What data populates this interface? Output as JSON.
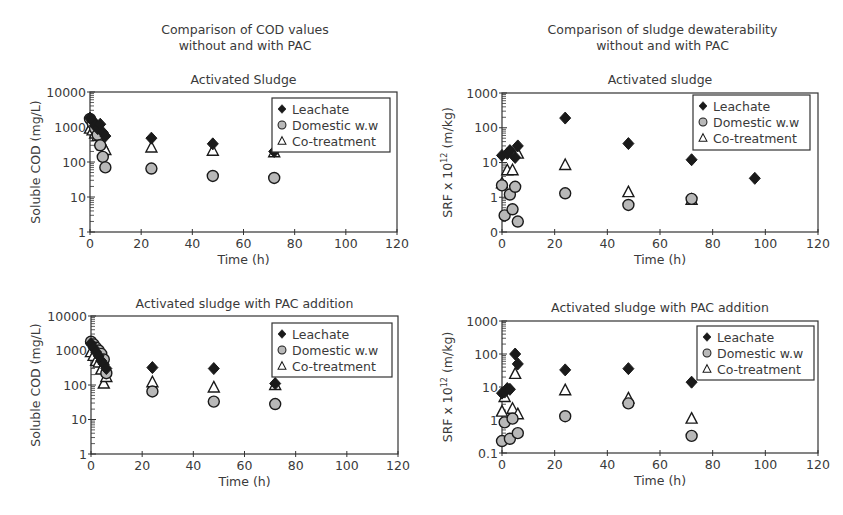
{
  "columns": {
    "left_title_line1": "Comparison of COD values",
    "left_title_line2": "without and with PAC",
    "right_title_line1": "Comparison of sludge dewaterability",
    "right_title_line2": "without and with PAC"
  },
  "legend": {
    "leachate": "Leachate",
    "domestic": "Domestic w.w",
    "cotreatment": "Co-treatment"
  },
  "colors": {
    "leachate_fill": "#1a1a1a",
    "domestic_fill": "#b8b8b8",
    "marker_stroke": "#1a1a1a",
    "axis": "#333333"
  },
  "chart_data": [
    {
      "id": "cod-as",
      "type": "scatter",
      "title": "Activated Sludge",
      "xlabel": "Time (h)",
      "ylabel": "Soluble COD (mg/L)",
      "xlim": [
        0,
        120
      ],
      "ylim": [
        1,
        10000
      ],
      "yscale": "log",
      "xticks": [
        "0",
        "20",
        "40",
        "60",
        "80",
        "100",
        "120"
      ],
      "yticks": [
        "1",
        "10",
        "100",
        "1000",
        "10000"
      ],
      "legend_position": "upper right",
      "grid": false,
      "series": [
        {
          "name": "Leachate",
          "marker": "diamond",
          "x": [
            0,
            1,
            2,
            3,
            4,
            5,
            6,
            24,
            48,
            72
          ],
          "y": [
            1800,
            1500,
            1100,
            900,
            1200,
            700,
            550,
            480,
            330,
            200
          ]
        },
        {
          "name": "Domestic w.w",
          "marker": "circle",
          "x": [
            0,
            1,
            2,
            3,
            4,
            5,
            6,
            24,
            48,
            72
          ],
          "y": [
            1700,
            1300,
            900,
            600,
            300,
            140,
            70,
            65,
            40,
            35
          ]
        },
        {
          "name": "Co-treatment",
          "marker": "triangle",
          "x": [
            0,
            1,
            2,
            3,
            4,
            5,
            6,
            24,
            48,
            72
          ],
          "y": [
            900,
            800,
            650,
            550,
            400,
            300,
            220,
            260,
            210,
            190
          ]
        }
      ]
    },
    {
      "id": "srf-as",
      "type": "scatter",
      "title": "Activated sludge",
      "xlabel": "Time (h)",
      "ylabel": "SRF x 10^12 (m/kg)",
      "xlim": [
        0,
        120
      ],
      "ylim": [
        0.1,
        1000
      ],
      "yscale": "log",
      "xticks": [
        "0",
        "20",
        "40",
        "60",
        "80",
        "100",
        "120"
      ],
      "yticks": [
        "0",
        "1",
        "10",
        "100",
        "1000"
      ],
      "legend_position": "upper right",
      "grid": false,
      "series": [
        {
          "name": "Leachate",
          "marker": "diamond",
          "x": [
            0,
            2,
            3,
            5,
            6,
            24,
            48,
            72,
            96
          ],
          "y": [
            16,
            18,
            22,
            14,
            30,
            190,
            35,
            12,
            3.5
          ]
        },
        {
          "name": "Domestic w.w",
          "marker": "circle",
          "x": [
            1,
            3,
            0,
            4,
            5,
            6,
            24,
            48,
            72
          ],
          "y": [
            0.3,
            1.2,
            2.2,
            0.45,
            2.0,
            0.2,
            1.3,
            0.6,
            0.9
          ]
        },
        {
          "name": "Co-treatment",
          "marker": "triangle",
          "x": [
            0,
            2,
            4,
            6,
            24,
            48,
            72
          ],
          "y": [
            2.5,
            6,
            6,
            18,
            8.5,
            1.4,
            0.85
          ]
        }
      ]
    },
    {
      "id": "cod-pac",
      "type": "scatter",
      "title": "Activated sludge with PAC addition",
      "xlabel": "Time (h)",
      "ylabel": "Soluble COD (mg/L)",
      "xlim": [
        0,
        120
      ],
      "ylim": [
        1,
        10000
      ],
      "yscale": "log",
      "xticks": [
        "0",
        "20",
        "40",
        "60",
        "80",
        "100",
        "120"
      ],
      "yticks": [
        "1",
        "10",
        "100",
        "1000",
        "10000"
      ],
      "legend_position": "upper right",
      "grid": false,
      "series": [
        {
          "name": "Leachate",
          "marker": "diamond",
          "x": [
            0,
            1,
            2,
            3,
            4,
            5,
            6,
            24,
            48,
            72
          ],
          "y": [
            1600,
            1200,
            900,
            700,
            500,
            400,
            300,
            320,
            300,
            110
          ]
        },
        {
          "name": "Domestic w.w",
          "marker": "circle",
          "x": [
            0,
            1,
            2,
            3,
            4,
            5,
            6,
            24,
            48,
            72
          ],
          "y": [
            1800,
            1500,
            1200,
            1000,
            800,
            550,
            220,
            65,
            33,
            28
          ]
        },
        {
          "name": "Co-treatment",
          "marker": "triangle",
          "x": [
            0,
            1,
            2,
            3,
            4,
            5,
            6,
            24,
            48,
            72
          ],
          "y": [
            900,
            700,
            500,
            450,
            280,
            110,
            170,
            120,
            85,
            100
          ]
        }
      ]
    },
    {
      "id": "srf-pac",
      "type": "scatter",
      "title": "Activated sludge with PAC addition",
      "xlabel": "Time (h)",
      "ylabel": "SRF x 10^12 (m/kg)",
      "xlim": [
        0,
        120
      ],
      "ylim": [
        0.1,
        1000
      ],
      "yscale": "log",
      "xticks": [
        "0",
        "20",
        "40",
        "60",
        "80",
        "100",
        "120"
      ],
      "yticks": [
        "0.1",
        "1",
        "10",
        "100",
        "1000"
      ],
      "legend_position": "upper right",
      "grid": false,
      "series": [
        {
          "name": "Leachate",
          "marker": "diamond",
          "x": [
            0,
            1,
            2,
            3,
            5,
            6,
            24,
            48,
            72
          ],
          "y": [
            6.5,
            7,
            9,
            8.5,
            100,
            50,
            33,
            36,
            14
          ]
        },
        {
          "name": "Domestic w.w",
          "marker": "circle",
          "x": [
            0,
            1,
            3,
            4,
            6,
            24,
            48,
            72
          ],
          "y": [
            0.23,
            0.85,
            0.27,
            1.1,
            0.4,
            1.3,
            3.2,
            0.33
          ]
        },
        {
          "name": "Co-treatment",
          "marker": "triangle",
          "x": [
            0,
            1,
            4,
            6,
            5,
            24,
            48,
            72
          ],
          "y": [
            1.8,
            5,
            2.2,
            1.5,
            25,
            8,
            4.5,
            1.1
          ]
        }
      ]
    }
  ]
}
